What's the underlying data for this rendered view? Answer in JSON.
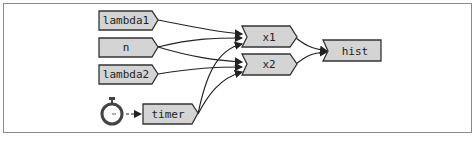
{
  "diagram": {
    "type": "dataflow-graph",
    "nodes": [
      {
        "id": "lambda1",
        "label": "lambda1"
      },
      {
        "id": "n",
        "label": "n"
      },
      {
        "id": "lambda2",
        "label": "lambda2"
      },
      {
        "id": "timer",
        "label": "timer"
      },
      {
        "id": "x1",
        "label": "x1"
      },
      {
        "id": "x2",
        "label": "x2"
      },
      {
        "id": "hist",
        "label": "hist"
      }
    ],
    "edges": [
      {
        "from": "lambda1",
        "to": "x1"
      },
      {
        "from": "n",
        "to": "x1"
      },
      {
        "from": "n",
        "to": "x2"
      },
      {
        "from": "lambda2",
        "to": "x2"
      },
      {
        "from": "timer",
        "to": "x1"
      },
      {
        "from": "timer",
        "to": "x2"
      },
      {
        "from": "x1",
        "to": "hist"
      },
      {
        "from": "x2",
        "to": "hist"
      },
      {
        "from": "stopwatch",
        "to": "timer",
        "style": "dashed"
      }
    ],
    "icons": [
      {
        "name": "stopwatch-icon"
      }
    ],
    "colors": {
      "node_fill": "#d4d4d4",
      "node_stroke": "#333333",
      "edge": "#222222"
    }
  }
}
